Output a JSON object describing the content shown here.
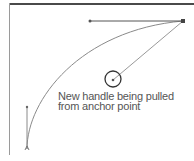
{
  "diagram": {
    "caption": {
      "line1": "New handle being pulled",
      "line2": "from anchor point"
    },
    "colors": {
      "frame_top": "#4a4a4a",
      "frame_left": "#9a9a9a",
      "curve": "#8a8a8a",
      "handle": "#555555",
      "anchor": "#444444",
      "text": "#555555",
      "cursor_circle": "#333333"
    },
    "elements": {
      "anchor_top_right": {
        "x": 183,
        "y": 21
      },
      "anchor_bottom_left": {
        "x": 27,
        "y": 149
      },
      "horizontal_handle_end": {
        "x": 90,
        "y": 21
      },
      "vertical_handle_end": {
        "x": 27,
        "y": 107
      },
      "new_handle_end": {
        "x": 113,
        "y": 80
      },
      "cursor_circle_radius": 8
    }
  }
}
